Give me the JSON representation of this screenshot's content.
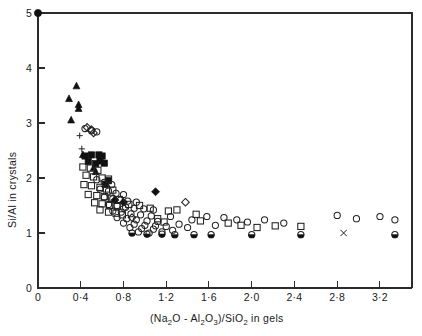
{
  "figure": {
    "title": "",
    "background_color": "#ffffff",
    "axis_color": "#2b2b2b",
    "marker_color": "#111111"
  },
  "axes": {
    "x_title_parts": {
      "open_paren": "(",
      "na": "Na",
      "na_sub": "2",
      "o1": "O",
      "minus": " - ",
      "al": "Al",
      "al_sub": "2",
      "o2": "O",
      "o2_sub": "3",
      "close_paren": ")",
      "slash": "/",
      "si": "SiO",
      "si_sub": "2",
      "tail": " in gels"
    },
    "x_title_plain": "(Na2O - Al2O3)/SiO2 in gels",
    "y_title": "Si/Al in crystals",
    "x_tick_labels": [
      "0",
      "0·4",
      "0·8",
      "1·2",
      "1·6",
      "2·0",
      "2·4",
      "2·8",
      "3·2"
    ],
    "y_tick_labels": [
      "0",
      "1",
      "2",
      "3",
      "4",
      "5"
    ]
  },
  "chart_data": {
    "type": "scatter",
    "title": "",
    "xlabel": "(Na2O - Al2O3)/SiO2 in gels",
    "ylabel": "Si/Al in crystals",
    "xlim": [
      0,
      3.5
    ],
    "ylim": [
      0,
      5
    ],
    "xticks": [
      0,
      0.4,
      0.8,
      1.2,
      1.6,
      2.0,
      2.4,
      2.8,
      3.2
    ],
    "yticks": [
      0,
      1,
      2,
      3,
      4,
      5
    ],
    "xtick_labels": [
      "0",
      "0·4",
      "0·8",
      "1·2",
      "1·6",
      "2·0",
      "2·4",
      "2·8",
      "3·2"
    ],
    "ytick_labels": [
      "0",
      "1",
      "2",
      "3",
      "4",
      "5"
    ],
    "grid": false,
    "legend": "none",
    "series": [
      {
        "name": "filled-circle",
        "marker": "filled-circle",
        "points": [
          [
            0.0,
            5.0
          ]
        ]
      },
      {
        "name": "filled-triangle",
        "marker": "filled-triangle",
        "points": [
          [
            0.36,
            3.67
          ],
          [
            0.29,
            3.44
          ],
          [
            0.38,
            3.33
          ],
          [
            0.38,
            3.26
          ],
          [
            0.31,
            3.05
          ],
          [
            0.42,
            2.42
          ],
          [
            0.52,
            2.18
          ],
          [
            0.54,
            2.11
          ]
        ]
      },
      {
        "name": "plus",
        "marker": "plus",
        "points": [
          [
            0.39,
            2.77
          ],
          [
            0.41,
            2.53
          ]
        ]
      },
      {
        "name": "filled-square",
        "marker": "filled-square",
        "points": [
          [
            0.44,
            2.4
          ],
          [
            0.5,
            2.42
          ],
          [
            0.57,
            2.42
          ],
          [
            0.6,
            2.4
          ],
          [
            0.58,
            2.31
          ],
          [
            0.47,
            2.3
          ],
          [
            0.54,
            2.26
          ],
          [
            0.62,
            2.27
          ],
          [
            0.66,
            1.95
          ],
          [
            0.63,
            1.88
          ]
        ]
      },
      {
        "name": "open-square",
        "marker": "open-square",
        "points": [
          [
            0.42,
            2.2
          ],
          [
            0.49,
            2.18
          ],
          [
            0.56,
            2.14
          ],
          [
            0.45,
            2.05
          ],
          [
            0.52,
            2.02
          ],
          [
            0.6,
            2.0
          ],
          [
            0.66,
            1.98
          ],
          [
            0.43,
            1.88
          ],
          [
            0.5,
            1.86
          ],
          [
            0.58,
            1.83
          ],
          [
            0.64,
            1.8
          ],
          [
            0.7,
            1.78
          ],
          [
            0.47,
            1.7
          ],
          [
            0.55,
            1.68
          ],
          [
            0.62,
            1.66
          ],
          [
            0.69,
            1.63
          ],
          [
            0.76,
            1.61
          ],
          [
            0.53,
            1.55
          ],
          [
            0.6,
            1.53
          ],
          [
            0.67,
            1.5
          ],
          [
            0.74,
            1.48
          ],
          [
            0.85,
            1.52
          ],
          [
            0.95,
            1.5
          ],
          [
            1.05,
            1.45
          ],
          [
            1.22,
            1.4
          ],
          [
            1.3,
            1.42
          ],
          [
            1.48,
            1.34
          ],
          [
            1.52,
            1.22
          ],
          [
            1.78,
            1.18
          ],
          [
            1.9,
            1.14
          ],
          [
            2.05,
            1.1
          ],
          [
            2.22,
            1.13
          ],
          [
            2.46,
            1.12
          ],
          [
            0.58,
            1.42
          ],
          [
            0.66,
            1.38
          ],
          [
            0.73,
            1.36
          ],
          [
            0.79,
            1.33
          ],
          [
            1.12,
            1.26
          ],
          [
            1.18,
            1.2
          ]
        ]
      },
      {
        "name": "open-diamond",
        "marker": "open-diamond",
        "points": [
          [
            0.46,
            2.92
          ],
          [
            0.5,
            2.88
          ],
          [
            0.52,
            2.82
          ],
          [
            1.38,
            1.56
          ],
          [
            0.8,
            1.45
          ],
          [
            0.88,
            1.28
          ]
        ]
      },
      {
        "name": "filled-diamond",
        "marker": "filled-diamond",
        "points": [
          [
            1.1,
            1.75
          ],
          [
            0.72,
            1.6
          ],
          [
            0.8,
            1.56
          ]
        ]
      },
      {
        "name": "open-circle",
        "marker": "open-circle",
        "points": [
          [
            0.44,
            2.9
          ],
          [
            0.5,
            2.86
          ],
          [
            0.55,
            2.84
          ],
          [
            0.55,
            1.97
          ],
          [
            0.62,
            1.92
          ],
          [
            0.69,
            1.88
          ],
          [
            0.58,
            1.8
          ],
          [
            0.66,
            1.76
          ],
          [
            0.73,
            1.72
          ],
          [
            0.8,
            1.7
          ],
          [
            0.62,
            1.65
          ],
          [
            0.7,
            1.62
          ],
          [
            0.77,
            1.6
          ],
          [
            0.84,
            1.58
          ],
          [
            0.92,
            1.56
          ],
          [
            0.66,
            1.52
          ],
          [
            0.74,
            1.5
          ],
          [
            0.82,
            1.47
          ],
          [
            0.9,
            1.45
          ],
          [
            0.99,
            1.44
          ],
          [
            1.08,
            1.42
          ],
          [
            0.7,
            1.4
          ],
          [
            0.78,
            1.38
          ],
          [
            0.87,
            1.35
          ],
          [
            0.96,
            1.33
          ],
          [
            1.06,
            1.31
          ],
          [
            0.74,
            1.28
          ],
          [
            0.83,
            1.26
          ],
          [
            0.92,
            1.24
          ],
          [
            1.02,
            1.22
          ],
          [
            1.12,
            1.21
          ],
          [
            1.24,
            1.3
          ],
          [
            0.8,
            1.18
          ],
          [
            0.9,
            1.16
          ],
          [
            1.0,
            1.14
          ],
          [
            1.1,
            1.13
          ],
          [
            1.2,
            1.12
          ],
          [
            0.86,
            1.1
          ],
          [
            0.97,
            1.08
          ],
          [
            1.08,
            1.07
          ],
          [
            1.32,
            1.16
          ],
          [
            1.44,
            1.24
          ],
          [
            1.4,
            1.1
          ],
          [
            1.58,
            1.3
          ],
          [
            1.66,
            1.14
          ],
          [
            1.74,
            1.28
          ],
          [
            1.86,
            1.24
          ],
          [
            1.96,
            1.2
          ],
          [
            2.12,
            1.24
          ],
          [
            2.3,
            1.18
          ],
          [
            2.8,
            1.32
          ],
          [
            2.98,
            1.26
          ],
          [
            3.2,
            1.3
          ],
          [
            3.34,
            1.24
          ],
          [
            0.94,
            1.02
          ],
          [
            1.04,
            1.0
          ],
          [
            1.16,
            1.02
          ],
          [
            1.26,
            1.05
          ]
        ]
      },
      {
        "name": "half-filled-circle",
        "marker": "half-filled-circle",
        "points": [
          [
            1.16,
            0.98
          ],
          [
            1.28,
            0.97
          ],
          [
            1.46,
            0.97
          ],
          [
            1.62,
            0.97
          ],
          [
            2.0,
            0.97
          ],
          [
            2.46,
            0.97
          ],
          [
            3.34,
            0.97
          ],
          [
            0.88,
            1.0
          ],
          [
            1.02,
            0.98
          ]
        ]
      },
      {
        "name": "x-cross",
        "marker": "x-cross",
        "points": [
          [
            2.86,
            1.0
          ]
        ]
      }
    ]
  }
}
